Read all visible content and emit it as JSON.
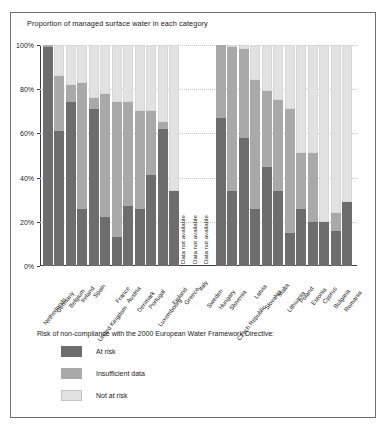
{
  "chart_data": {
    "type": "bar",
    "title": "Proportion of managed surface water in each category",
    "xlabel": "",
    "ylabel": "",
    "ylim": [
      0,
      100
    ],
    "stacked": true,
    "grid": true,
    "legend_position": "below",
    "legend_title": "Risk of non-compliance with the 2000 European Water Framework Directive:",
    "ytick_labels": [
      "100%",
      "80%",
      "60%",
      "40%",
      "20%",
      "0%"
    ],
    "ytick_values": [
      100,
      80,
      60,
      40,
      20,
      0
    ],
    "na_label": "Data not available",
    "series": [
      {
        "name": "At risk",
        "color": "#6d6d6d"
      },
      {
        "name": "Insufficient data",
        "color": "#a9a9a9"
      },
      {
        "name": "Not at risk",
        "color": "#e2e2e2"
      }
    ],
    "categories": [
      "Netherlands",
      "Germany",
      "Belgium",
      "Ireland",
      "Spain",
      "United Kingdom",
      "France",
      "Austria",
      "Denmark",
      "Portugal",
      "Luxembourg",
      "Finland",
      "Greece",
      "Italy",
      "Sweden",
      "Hungary",
      "Slovenia",
      "Czech Republic",
      "Latvia",
      "Slovakia",
      "Malta",
      "Lithuania",
      "Poland",
      "Estonia",
      "Cyprus",
      "Bulgaria",
      "Romania"
    ],
    "points": [
      {
        "category": "Netherlands",
        "at_risk": 99,
        "insufficient": 1,
        "not_at_risk": 0,
        "available": true
      },
      {
        "category": "Germany",
        "at_risk": 61,
        "insufficient": 25,
        "not_at_risk": 14,
        "available": true
      },
      {
        "category": "Belgium",
        "at_risk": 74,
        "insufficient": 8,
        "not_at_risk": 18,
        "available": true
      },
      {
        "category": "Ireland",
        "at_risk": 26,
        "insufficient": 57,
        "not_at_risk": 17,
        "available": true
      },
      {
        "category": "Spain",
        "at_risk": 71,
        "insufficient": 5,
        "not_at_risk": 24,
        "available": true
      },
      {
        "category": "United Kingdom",
        "at_risk": 22,
        "insufficient": 56,
        "not_at_risk": 22,
        "available": true
      },
      {
        "category": "France",
        "at_risk": 13,
        "insufficient": 61,
        "not_at_risk": 26,
        "available": true
      },
      {
        "category": "Austria",
        "at_risk": 27,
        "insufficient": 47,
        "not_at_risk": 26,
        "available": true
      },
      {
        "category": "Denmark",
        "at_risk": 26,
        "insufficient": 44,
        "not_at_risk": 30,
        "available": true
      },
      {
        "category": "Portugal",
        "at_risk": 41,
        "insufficient": 29,
        "not_at_risk": 30,
        "available": true
      },
      {
        "category": "Luxembourg",
        "at_risk": 62,
        "insufficient": 3,
        "not_at_risk": 35,
        "available": true
      },
      {
        "category": "Finland",
        "at_risk": 34,
        "insufficient": 0,
        "not_at_risk": 66,
        "available": true
      },
      {
        "category": "Greece",
        "at_risk": 0,
        "insufficient": 0,
        "not_at_risk": 0,
        "available": false
      },
      {
        "category": "Italy",
        "at_risk": 0,
        "insufficient": 0,
        "not_at_risk": 0,
        "available": false
      },
      {
        "category": "Sweden",
        "at_risk": 0,
        "insufficient": 0,
        "not_at_risk": 0,
        "available": false
      },
      {
        "category": "Hungary",
        "at_risk": 67,
        "insufficient": 33,
        "not_at_risk": 0,
        "available": true
      },
      {
        "category": "Slovenia",
        "at_risk": 34,
        "insufficient": 65,
        "not_at_risk": 1,
        "available": true
      },
      {
        "category": "Czech Republic",
        "at_risk": 58,
        "insufficient": 40,
        "not_at_risk": 2,
        "available": true
      },
      {
        "category": "Latvia",
        "at_risk": 26,
        "insufficient": 58,
        "not_at_risk": 16,
        "available": true
      },
      {
        "category": "Slovakia",
        "at_risk": 45,
        "insufficient": 34,
        "not_at_risk": 21,
        "available": true
      },
      {
        "category": "Malta",
        "at_risk": 34,
        "insufficient": 41,
        "not_at_risk": 25,
        "available": true
      },
      {
        "category": "Lithuania",
        "at_risk": 15,
        "insufficient": 56,
        "not_at_risk": 29,
        "available": true
      },
      {
        "category": "Poland",
        "at_risk": 26,
        "insufficient": 25,
        "not_at_risk": 49,
        "available": true
      },
      {
        "category": "Estonia",
        "at_risk": 20,
        "insufficient": 31,
        "not_at_risk": 49,
        "available": true
      },
      {
        "category": "Cyprus",
        "at_risk": 20,
        "insufficient": 0,
        "not_at_risk": 80,
        "available": true
      },
      {
        "category": "Bulgaria",
        "at_risk": 16,
        "insufficient": 8,
        "not_at_risk": 76,
        "available": true
      },
      {
        "category": "Romania",
        "at_risk": 29,
        "insufficient": 0,
        "not_at_risk": 71,
        "available": true
      }
    ]
  },
  "legend": {
    "title": "Risk of non-compliance with the 2000 European Water Framework Directive:",
    "items": [
      {
        "label": "At risk",
        "color": "#6d6d6d"
      },
      {
        "label": "Insufficient data",
        "color": "#a9a9a9"
      },
      {
        "label": "Not at risk",
        "color": "#e2e2e2"
      }
    ]
  }
}
